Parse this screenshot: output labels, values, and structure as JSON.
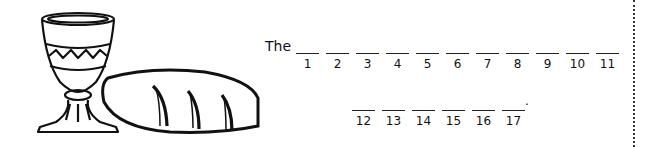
{
  "puzzle": {
    "prefix": "The",
    "row1": [
      {
        "num": "1",
        "x": 296
      },
      {
        "num": "2",
        "x": 326
      },
      {
        "num": "3",
        "x": 356
      },
      {
        "num": "4",
        "x": 386
      },
      {
        "num": "5",
        "x": 416
      },
      {
        "num": "6",
        "x": 446
      },
      {
        "num": "7",
        "x": 476
      },
      {
        "num": "8",
        "x": 506
      },
      {
        "num": "9",
        "x": 536
      },
      {
        "num": "10",
        "x": 566
      },
      {
        "num": "11",
        "x": 596
      }
    ],
    "row2": [
      {
        "num": "12",
        "x": 352
      },
      {
        "num": "13",
        "x": 382
      },
      {
        "num": "14",
        "x": 412
      },
      {
        "num": "15",
        "x": 442
      },
      {
        "num": "16",
        "x": 472
      },
      {
        "num": "17",
        "x": 502
      }
    ],
    "end_punctuation": "."
  },
  "illustration": {
    "items": [
      "chalice-icon",
      "bread-loaf-icon"
    ]
  }
}
